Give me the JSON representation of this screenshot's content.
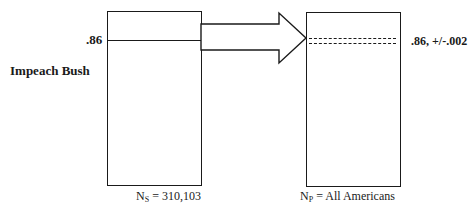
{
  "diagram": {
    "row_label": "Impeach Bush",
    "sample": {
      "value_label": ".86",
      "caption_prefix": "N",
      "caption_subscript": "S",
      "caption_rest": " = 310,103"
    },
    "population": {
      "value_label": ".86, +/-.002",
      "caption_prefix": "N",
      "caption_subscript": "P",
      "caption_rest": " = All Americans"
    },
    "arrow": {
      "direction": "right",
      "meaning": "inference from sample to population"
    },
    "colors": {
      "line": "#1a1a1a",
      "background": "#ffffff"
    }
  }
}
